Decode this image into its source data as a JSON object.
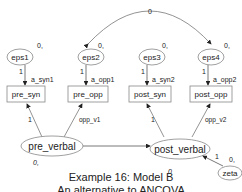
{
  "diagram": {
    "caption_line1": "Example 16: Model B",
    "caption_line2": "An alternative to ANCOVA",
    "covariance_label": "0",
    "errors": [
      {
        "name": "eps1",
        "variance": "0,",
        "path": "1"
      },
      {
        "name": "eps2",
        "variance": "0,",
        "path": "1"
      },
      {
        "name": "eps3",
        "variance": "0,",
        "path": "1"
      },
      {
        "name": "eps4",
        "variance": "0,",
        "path": "1"
      }
    ],
    "observed": [
      {
        "name": "pre_syn",
        "intercept": "a_syn1"
      },
      {
        "name": "pre_opp",
        "intercept": "a_opp1"
      },
      {
        "name": "post_syn",
        "intercept": "a_syn2"
      },
      {
        "name": "post_opp",
        "intercept": "a_opp2"
      }
    ],
    "latent": [
      {
        "name": "pre_verbal",
        "mean": "0,",
        "loadings": [
          "1",
          "opp_v1"
        ]
      },
      {
        "name": "post_verbal",
        "mean": "0",
        "loadings": [
          "1",
          "opp_v2"
        ]
      }
    ],
    "disturbance": {
      "name": "zeta",
      "variance": "0,",
      "path": "1"
    },
    "colors": {
      "line": "#555555",
      "text": "#222222",
      "background": "#ffffff"
    }
  }
}
